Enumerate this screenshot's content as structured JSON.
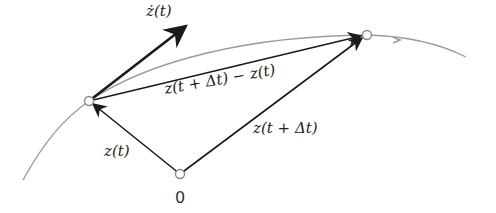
{
  "diagram": {
    "type": "vector-derivative-diagram",
    "labels": {
      "derivative": "ż(t)",
      "difference": "z(t + Δt) − z(t)",
      "position_t": "z(t)",
      "position_t_dt": "z(t + Δt)",
      "origin": "0"
    },
    "points": {
      "origin": {
        "x": 180,
        "y": 174
      },
      "z_t": {
        "x": 89,
        "y": 101
      },
      "z_t_dt": {
        "x": 367,
        "y": 35
      }
    },
    "colors": {
      "vector": "#1a1a1a",
      "curve": "#9a9a9a",
      "point_stroke": "#888888"
    }
  }
}
